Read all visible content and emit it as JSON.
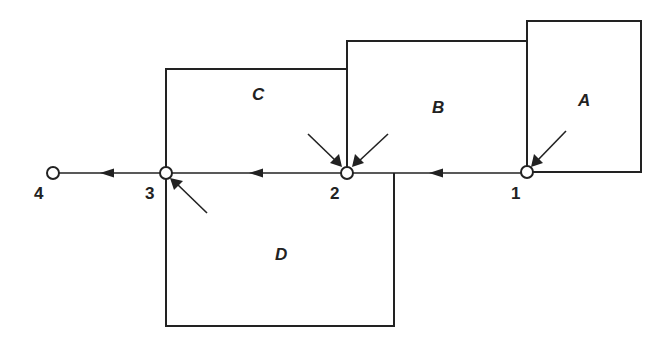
{
  "diagram": {
    "type": "drainage-area-flow-network",
    "colors": {
      "stroke": "#222222",
      "background": "#ffffff"
    },
    "regions": [
      {
        "id": "A",
        "label": "A"
      },
      {
        "id": "B",
        "label": "B"
      },
      {
        "id": "C",
        "label": "C"
      },
      {
        "id": "D",
        "label": "D"
      }
    ],
    "nodes": [
      {
        "id": "1",
        "label": "1"
      },
      {
        "id": "2",
        "label": "2"
      },
      {
        "id": "3",
        "label": "3"
      },
      {
        "id": "4",
        "label": "4"
      }
    ],
    "flow_edges": [
      {
        "from": "1",
        "to": "2"
      },
      {
        "from": "2",
        "to": "3"
      },
      {
        "from": "3",
        "to": "4"
      }
    ],
    "inflows": [
      {
        "region": "A",
        "to_node": "1"
      },
      {
        "region": "C",
        "to_node": "2"
      },
      {
        "region": "B",
        "to_node": "2"
      },
      {
        "region": "D",
        "to_node": "3"
      }
    ]
  }
}
